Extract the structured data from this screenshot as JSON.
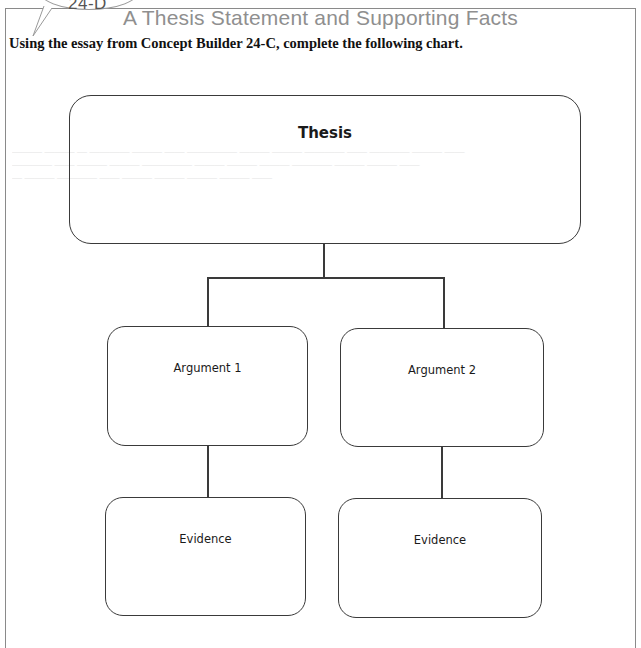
{
  "header": {
    "badge_label": "24-D",
    "title": "A Thesis Statement and Supporting Facts",
    "instructions": "Using the essay from Concept Builder 24-C, complete the following chart."
  },
  "chart": {
    "thesis": {
      "label": "Thesis"
    },
    "arguments": [
      {
        "label": "Argument 1"
      },
      {
        "label": "Argument 2"
      }
    ],
    "evidence": [
      {
        "label": "Evidence"
      },
      {
        "label": "Evidence"
      }
    ]
  },
  "colors": {
    "title_gray": "#8f8f8f",
    "line": "#3a3a3a",
    "frame": "#8a8a8a"
  }
}
